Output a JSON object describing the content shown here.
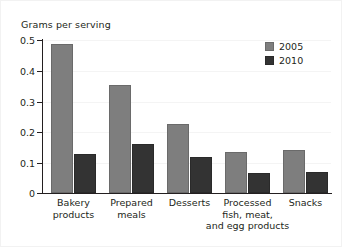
{
  "chart_data": {
    "type": "bar",
    "title": "Grams per serving",
    "xlabel": "",
    "ylabel": "Grams per serving",
    "ylim": [
      0,
      0.5
    ],
    "yticks": [
      "0",
      "0.1",
      "0.2",
      "0.3",
      "0.4",
      "0.5"
    ],
    "grid": false,
    "legend_position": "top-right",
    "categories": [
      "Bakery\nproducts",
      "Prepared\nmeals",
      "Desserts",
      "Processed\nfish, meat,\nand egg products",
      "Snacks"
    ],
    "series": [
      {
        "name": "2005",
        "color": "#7e7e7e",
        "values": [
          0.487,
          0.354,
          0.226,
          0.135,
          0.141
        ]
      },
      {
        "name": "2010",
        "color": "#333333",
        "values": [
          0.129,
          0.161,
          0.117,
          0.067,
          0.07
        ]
      }
    ]
  }
}
